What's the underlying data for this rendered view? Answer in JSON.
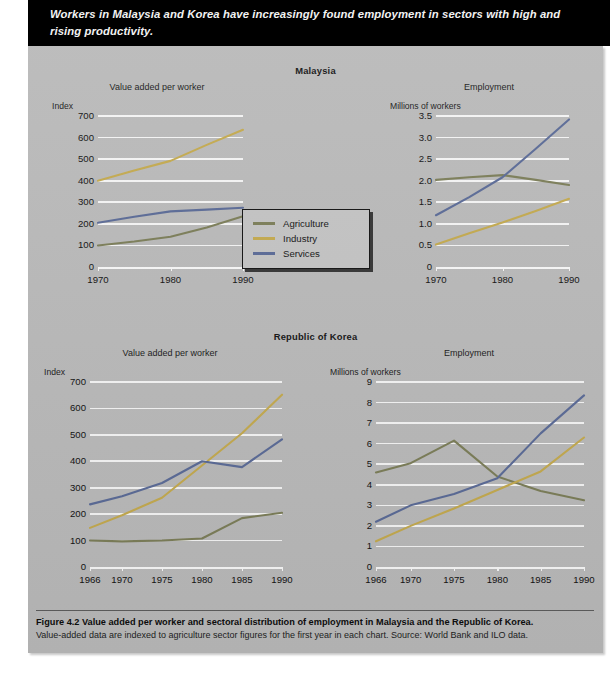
{
  "banner": {
    "text": "Workers in Malaysia and Korea have increasingly found employment in sectors with high and rising productivity."
  },
  "sections": [
    {
      "country_title": "Malaysia"
    },
    {
      "country_title": "Republic of Korea"
    }
  ],
  "legend": {
    "items": [
      {
        "label": "Agriculture",
        "color": "#7b7d58"
      },
      {
        "label": "Industry",
        "color": "#c3a94e"
      },
      {
        "label": "Services",
        "color": "#5a6a96"
      }
    ]
  },
  "caption": {
    "title": "Figure 4.2  Value added per worker and sectoral distribution of employment in Malaysia and the Republic of Korea.",
    "body": "Value-added data are indexed to agriculture sector figures for the first year in each chart.  Source: World Bank and ILO data."
  },
  "colors": {
    "agriculture": "#7b7d58",
    "industry": "#c3a94e",
    "services": "#5a6a96",
    "panel_bg": "#b9b9b9",
    "grid": "#f4f4f4",
    "banner_bg": "#000000",
    "text": "#141414"
  },
  "chart_data": [
    {
      "id": "malaysia-value-added",
      "type": "line",
      "title": "Value added per worker",
      "country": "Malaysia",
      "ylabel": "Index",
      "xlabel": "",
      "x": [
        1970,
        1975,
        1980,
        1985,
        1990
      ],
      "xticks": [
        1970,
        1980,
        1990
      ],
      "xlim": [
        1970,
        1990
      ],
      "ylim": [
        0,
        700
      ],
      "yticks": [
        0,
        100,
        200,
        300,
        400,
        500,
        600,
        700
      ],
      "grid": true,
      "legend_position": "external-center",
      "series": [
        {
          "name": "Agriculture",
          "color": "#7b7d58",
          "values": [
            100,
            118,
            140,
            183,
            235
          ]
        },
        {
          "name": "Industry",
          "color": "#c3a94e",
          "values": [
            400,
            447,
            492,
            566,
            636
          ]
        },
        {
          "name": "Services",
          "color": "#5a6a96",
          "values": [
            205,
            233,
            258,
            266,
            275
          ]
        }
      ]
    },
    {
      "id": "malaysia-employment",
      "type": "line",
      "title": "Employment",
      "country": "Malaysia",
      "ylabel": "Millions of workers",
      "xlabel": "",
      "x": [
        1970,
        1975,
        1980,
        1985,
        1990
      ],
      "xticks": [
        1970,
        1980,
        1990
      ],
      "xlim": [
        1970,
        1990
      ],
      "ylim": [
        0,
        3.5
      ],
      "yticks": [
        0,
        0.5,
        1.0,
        1.5,
        2.0,
        2.5,
        3.0,
        3.5
      ],
      "ytick_labels": [
        "0",
        "0.5",
        "1.0",
        "1.5",
        "2.0",
        "2.5",
        "3.0",
        "3.5"
      ],
      "grid": true,
      "series": [
        {
          "name": "Agriculture",
          "color": "#7b7d58",
          "values": [
            2.02,
            2.08,
            2.13,
            2.02,
            1.9
          ]
        },
        {
          "name": "Industry",
          "color": "#c3a94e",
          "values": [
            0.52,
            0.78,
            1.03,
            1.3,
            1.58
          ]
        },
        {
          "name": "Services",
          "color": "#5a6a96",
          "values": [
            1.2,
            1.62,
            2.08,
            2.74,
            3.42
          ]
        }
      ]
    },
    {
      "id": "korea-value-added",
      "type": "line",
      "title": "Value added per worker",
      "country": "Republic of Korea",
      "ylabel": "Index",
      "xlabel": "",
      "x": [
        1966,
        1970,
        1975,
        1980,
        1985,
        1990
      ],
      "xticks": [
        1966,
        1970,
        1975,
        1980,
        1985,
        1990
      ],
      "xlim": [
        1966,
        1990
      ],
      "ylim": [
        0,
        700
      ],
      "yticks": [
        0,
        100,
        200,
        300,
        400,
        500,
        600,
        700
      ],
      "grid": true,
      "series": [
        {
          "name": "Agriculture",
          "color": "#7b7d58",
          "values": [
            100,
            97,
            100,
            108,
            185,
            205
          ]
        },
        {
          "name": "Industry",
          "color": "#c3a94e",
          "values": [
            148,
            196,
            262,
            384,
            506,
            652
          ]
        },
        {
          "name": "Services",
          "color": "#5a6a96",
          "values": [
            237,
            268,
            318,
            400,
            378,
            483
          ]
        }
      ]
    },
    {
      "id": "korea-employment",
      "type": "line",
      "title": "Employment",
      "country": "Republic of Korea",
      "ylabel": "Millions of workers",
      "xlabel": "",
      "x": [
        1966,
        1970,
        1975,
        1980,
        1985,
        1990
      ],
      "xticks": [
        1966,
        1970,
        1975,
        1980,
        1985,
        1990
      ],
      "xlim": [
        1966,
        1990
      ],
      "ylim": [
        0,
        9
      ],
      "yticks": [
        0,
        1,
        2,
        3,
        4,
        5,
        6,
        7,
        8,
        9
      ],
      "grid": true,
      "series": [
        {
          "name": "Agriculture",
          "color": "#7b7d58",
          "values": [
            4.6,
            5.05,
            6.15,
            4.4,
            3.7,
            3.25
          ]
        },
        {
          "name": "Industry",
          "color": "#c3a94e",
          "values": [
            1.25,
            2.0,
            2.85,
            3.75,
            4.65,
            6.3
          ]
        },
        {
          "name": "Services",
          "color": "#5a6a96",
          "values": [
            2.2,
            3.0,
            3.55,
            4.32,
            6.5,
            8.35
          ]
        }
      ]
    }
  ]
}
